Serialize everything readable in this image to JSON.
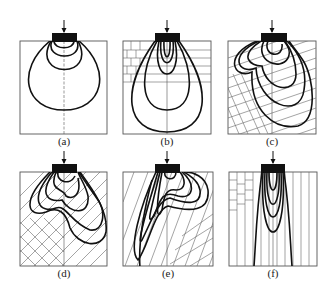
{
  "figure": {
    "panels": [
      {
        "id": "a",
        "label": "(a)",
        "medium": "homogeneous, isotropic"
      },
      {
        "id": "b",
        "label": "(b)",
        "medium": "horizontal bedding with brick joints in upper-left"
      },
      {
        "id": "c",
        "label": "(c)",
        "medium": "inclined bedding, right side hatched; lower-left blocky"
      },
      {
        "id": "d",
        "label": "(d)",
        "medium": "inclined bedding dipping right; lower-left blocky"
      },
      {
        "id": "e",
        "label": "(e)",
        "medium": "steeply inclined bedding; lower-right blocky"
      },
      {
        "id": "f",
        "label": "(f)",
        "medium": "vertical bedding with brick joints in upper-left"
      }
    ],
    "colors": {
      "ink": "#111111",
      "hatch": "#666666",
      "frame": "#555555",
      "background": "#ffffff"
    }
  }
}
